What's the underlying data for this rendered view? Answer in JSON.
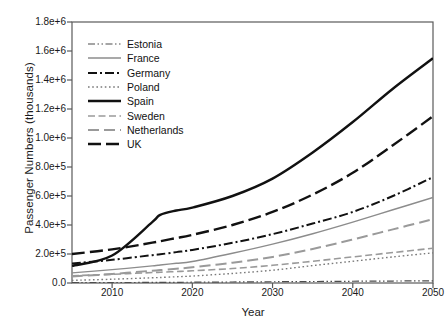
{
  "chart_data": {
    "type": "line",
    "title": "",
    "xlabel": "Year",
    "ylabel": "Passenger Numbers (thousands)",
    "xlim": [
      2005,
      2050
    ],
    "ylim": [
      0,
      1800000
    ],
    "grid": false,
    "legend_position": "upper-left-inside",
    "xticks": [
      2010,
      2020,
      2030,
      2040,
      2050
    ],
    "xticklabels": [
      "2010",
      "2020",
      "2030",
      "2040",
      "2050"
    ],
    "yticks": [
      0,
      200000,
      400000,
      600000,
      800000,
      1000000,
      1200000,
      1400000,
      1600000,
      1800000
    ],
    "yticklabels": [
      "0.0",
      "2.0e+5",
      "4.0e+5",
      "6.0e+5",
      "8.0e+5",
      "1.0e+6",
      "1.2e+6",
      "1.4e+6",
      "1.6e+6",
      "1.8e+6"
    ],
    "x": [
      2005,
      2010,
      2015,
      2016,
      2018,
      2020,
      2025,
      2030,
      2035,
      2040,
      2045,
      2050
    ],
    "series": [
      {
        "name": "Estonia",
        "style": "dash-dot-dot",
        "color": "#4d4d4d",
        "width": 1.2,
        "values": [
          2000,
          3000,
          4000,
          4200,
          4800,
          5400,
          7000,
          8600,
          10300,
          12000,
          13600,
          15000
        ]
      },
      {
        "name": "France",
        "style": "solid-thin",
        "color": "#8c8c8c",
        "width": 1.4,
        "values": [
          70000,
          92000,
          118000,
          124000,
          136000,
          148000,
          205000,
          268000,
          340000,
          420000,
          505000,
          590000
        ]
      },
      {
        "name": "Germany",
        "style": "dash-dot",
        "color": "#111111",
        "width": 2.0,
        "values": [
          135000,
          160000,
          192000,
          198000,
          213000,
          228000,
          277000,
          337000,
          410000,
          490000,
          600000,
          730000
        ]
      },
      {
        "name": "Poland",
        "style": "dotted",
        "color": "#7a7a7a",
        "width": 1.4,
        "values": [
          18000,
          26000,
          36000,
          38000,
          43000,
          48000,
          66000,
          88000,
          120000,
          150000,
          180000,
          208000
        ]
      },
      {
        "name": "Spain",
        "style": "solid-thick",
        "color": "#111111",
        "width": 2.4,
        "values": [
          118000,
          190000,
          420000,
          470000,
          500000,
          520000,
          600000,
          720000,
          900000,
          1110000,
          1340000,
          1550000
        ]
      },
      {
        "name": "Sweden",
        "style": "dashed-light",
        "color": "#9a9a9a",
        "width": 1.6,
        "values": [
          50000,
          60000,
          72000,
          74000,
          79000,
          84000,
          100000,
          122000,
          150000,
          180000,
          210000,
          240000
        ]
      },
      {
        "name": "Netherlands",
        "style": "dashed-long-light",
        "color": "#9a9a9a",
        "width": 2.0,
        "values": [
          45000,
          62000,
          85000,
          89000,
          98000,
          108000,
          140000,
          180000,
          235000,
          300000,
          370000,
          440000
        ]
      },
      {
        "name": "UK",
        "style": "dashed-thick",
        "color": "#111111",
        "width": 2.4,
        "values": [
          200000,
          232000,
          278000,
          288000,
          310000,
          332000,
          400000,
          490000,
          610000,
          760000,
          950000,
          1150000
        ]
      }
    ]
  }
}
